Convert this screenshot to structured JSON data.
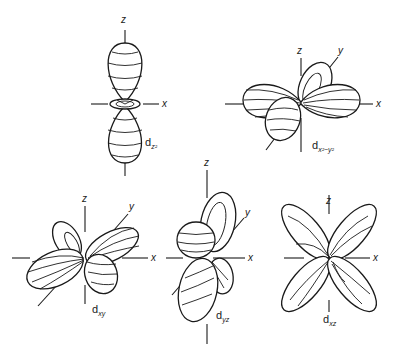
{
  "figure": {
    "title": "",
    "orbitals": [
      {
        "id": "dz2",
        "label_main": "d",
        "label_sub": "z²",
        "axes": [
          "z",
          "x"
        ]
      },
      {
        "id": "dx2-y2",
        "label_main": "d",
        "label_sub": "x²−y²",
        "axes": [
          "z",
          "y",
          "x"
        ]
      },
      {
        "id": "dxy",
        "label_main": "d",
        "label_sub": "xy",
        "axes": [
          "z",
          "y",
          "x"
        ]
      },
      {
        "id": "dyz",
        "label_main": "d",
        "label_sub": "yz",
        "axes": [
          "z",
          "y",
          "x"
        ]
      },
      {
        "id": "dxz",
        "label_main": "d",
        "label_sub": "xz",
        "axes": [
          "z",
          "x"
        ]
      }
    ]
  },
  "colors": {
    "line": "#1a1a1a",
    "background": "#ffffff"
  }
}
